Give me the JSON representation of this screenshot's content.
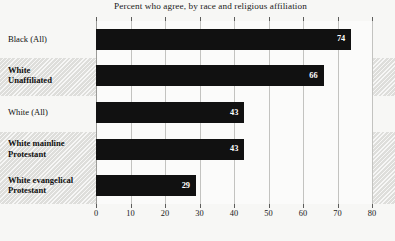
{
  "chart_data": {
    "type": "bar",
    "orientation": "horizontal",
    "title": "Percent who agree, by race and religious affiliation",
    "xlabel": "",
    "ylabel": "",
    "xlim": [
      0,
      80
    ],
    "xticks": [
      0,
      10,
      20,
      30,
      40,
      50,
      60,
      70,
      80
    ],
    "grid": true,
    "legend": "none",
    "bar_color": "#111111",
    "band_color": "#dededb",
    "categories": [
      "Black (All)",
      "White Unaffiliated",
      "White (All)",
      "White mainline Protestant",
      "White evangelical Protestant"
    ],
    "values": [
      74,
      66,
      43,
      43,
      29
    ]
  },
  "categories": [
    {
      "line1": "Black (All)",
      "line2": "",
      "bold": false,
      "value": 74,
      "value_label": "74"
    },
    {
      "line1": "White",
      "line2": "Unaffiliated",
      "bold": true,
      "value": 66,
      "value_label": "66"
    },
    {
      "line1": "White (All)",
      "line2": "",
      "bold": false,
      "value": 43,
      "value_label": "43"
    },
    {
      "line1": "White mainline",
      "line2": "Protestant",
      "bold": true,
      "value": 43,
      "value_label": "43"
    },
    {
      "line1": "White evangelical",
      "line2": "Protestant",
      "bold": true,
      "value": 29,
      "value_label": "29"
    }
  ],
  "axis": {
    "ticks": [
      "0",
      "10",
      "20",
      "30",
      "40",
      "50",
      "60",
      "70",
      "80"
    ]
  }
}
